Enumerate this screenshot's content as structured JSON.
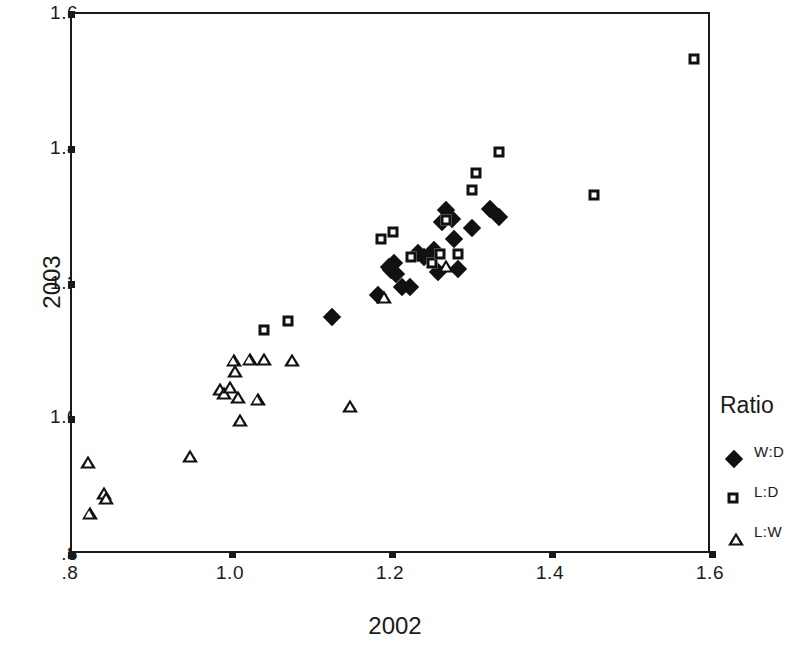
{
  "chart_data": {
    "type": "scatter",
    "title": "",
    "xlabel": "2002",
    "ylabel": "2003",
    "xlim": [
      0.8,
      1.6
    ],
    "ylim": [
      0.8,
      1.6
    ],
    "xticks": [
      ".8",
      "1.0",
      "1.2",
      "1.4",
      "1.6"
    ],
    "xtick_values": [
      0.8,
      1.0,
      1.2,
      1.4,
      1.6
    ],
    "yticks": [
      ".8",
      "1.0",
      "1.2",
      "1.4",
      "1.6"
    ],
    "ytick_values": [
      0.8,
      1.0,
      1.2,
      1.4,
      1.6
    ],
    "grid": false,
    "legend_title": "Ratio",
    "legend_position": "right",
    "series": [
      {
        "name": "W:D",
        "marker": "filled-diamond",
        "color": "#111111",
        "points": [
          [
            1.125,
            1.152
          ],
          [
            1.182,
            1.184
          ],
          [
            1.196,
            1.226
          ],
          [
            1.199,
            1.222
          ],
          [
            1.203,
            1.232
          ],
          [
            1.205,
            1.215
          ],
          [
            1.212,
            1.196
          ],
          [
            1.222,
            1.196
          ],
          [
            1.232,
            1.247
          ],
          [
            1.24,
            1.24
          ],
          [
            1.252,
            1.251
          ],
          [
            1.258,
            1.218
          ],
          [
            1.262,
            1.292
          ],
          [
            1.268,
            1.31
          ],
          [
            1.275,
            1.297
          ],
          [
            1.278,
            1.268
          ],
          [
            1.282,
            1.223
          ],
          [
            1.3,
            1.284
          ],
          [
            1.322,
            1.312
          ],
          [
            1.334,
            1.3
          ]
        ]
      },
      {
        "name": "L:D",
        "marker": "open-square",
        "color": "#111111",
        "points": [
          [
            1.04,
            1.133
          ],
          [
            1.07,
            1.146
          ],
          [
            1.186,
            1.268
          ],
          [
            1.201,
            1.277
          ],
          [
            1.224,
            1.24
          ],
          [
            1.25,
            1.232
          ],
          [
            1.26,
            1.245
          ],
          [
            1.268,
            1.296
          ],
          [
            1.283,
            1.245
          ],
          [
            1.3,
            1.34
          ],
          [
            1.305,
            1.365
          ],
          [
            1.334,
            1.396
          ],
          [
            1.452,
            1.333
          ],
          [
            1.578,
            1.534
          ]
        ]
      },
      {
        "name": "L:W",
        "marker": "open-triangle",
        "color": "#111111",
        "points": [
          [
            0.82,
            0.938
          ],
          [
            0.822,
            0.862
          ],
          [
            0.84,
            0.892
          ],
          [
            0.843,
            0.884
          ],
          [
            0.948,
            0.946
          ],
          [
            0.985,
            1.045
          ],
          [
            0.99,
            1.04
          ],
          [
            0.998,
            1.048
          ],
          [
            1.002,
            1.088
          ],
          [
            1.004,
            1.072
          ],
          [
            1.008,
            1.033
          ],
          [
            1.01,
            1.0
          ],
          [
            1.022,
            1.09
          ],
          [
            1.032,
            1.03
          ],
          [
            1.04,
            1.09
          ],
          [
            1.075,
            1.088
          ],
          [
            1.148,
            1.021
          ],
          [
            1.19,
            1.182
          ],
          [
            1.268,
            1.228
          ]
        ]
      }
    ]
  },
  "legend": {
    "title": "Ratio",
    "entries": [
      {
        "label": "W:D",
        "marker": "filled-diamond"
      },
      {
        "label": "L:D",
        "marker": "open-square"
      },
      {
        "label": "L:W",
        "marker": "open-triangle"
      }
    ]
  },
  "axes": {
    "x_title": "2002",
    "y_title": "2003"
  }
}
